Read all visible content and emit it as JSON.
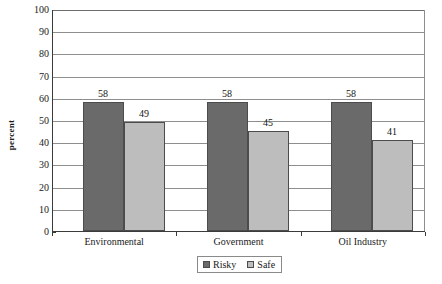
{
  "chart_data": {
    "type": "bar",
    "title": "",
    "subtitle": "",
    "xlabel": "",
    "ylabel": "percent",
    "categories": [
      "Environmental",
      "Government",
      "Oil Industry"
    ],
    "series": [
      {
        "name": "Risky",
        "values": [
          58,
          58,
          58
        ],
        "color": "#6a6a6a"
      },
      {
        "name": "Safe",
        "values": [
          49,
          45,
          41
        ],
        "color": "#bdbdbd"
      }
    ],
    "ylim": [
      0,
      100
    ],
    "ytick_step": 10,
    "ytick_labels": [
      "100",
      "90",
      "80",
      "70",
      "60",
      "50",
      "40",
      "30",
      "20",
      "10",
      "0"
    ],
    "grid": true,
    "grid_axis": "y",
    "legend_position": "bottom-center",
    "data_labels": true
  },
  "legend": {
    "entries": [
      {
        "label": "Risky"
      },
      {
        "label": "Safe"
      }
    ]
  }
}
